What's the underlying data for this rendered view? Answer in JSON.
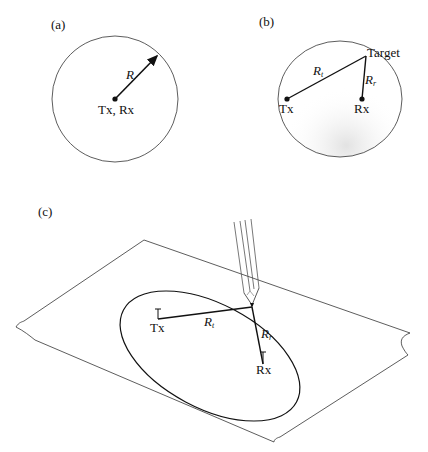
{
  "panels": {
    "a": {
      "label": "(a)",
      "radius_label": "R",
      "center_label": "Tx, Rx"
    },
    "b": {
      "label": "(b)",
      "target_label": "Target",
      "rt_label": "R",
      "rt_sub": "t",
      "rr_label": "R",
      "rr_sub": "r",
      "tx_label": "Tx",
      "rx_label": "Rx"
    },
    "c": {
      "label": "(c)",
      "rt_label": "R",
      "rt_sub": "t",
      "rr_label": "R",
      "rr_sub": "r",
      "tx_label": "Tx",
      "rx_label": "Rx"
    }
  }
}
